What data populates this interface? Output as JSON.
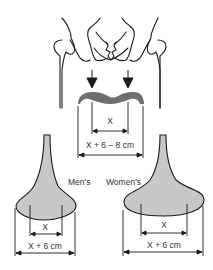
{
  "diagram": {
    "labels": {
      "pelvis_x": "X",
      "pelvis_width": "X + 6 – 8 cm",
      "mens_label": "Men's",
      "womens_label": "Women's",
      "mens_x": "X",
      "mens_width": "X + 6 cm",
      "womens_x": "X",
      "womens_width": "X + 6 cm"
    },
    "colors": {
      "line": "#1a1a1a",
      "imprint": "#6e6e6e",
      "saddle_fill": "#c8c8c8"
    }
  }
}
